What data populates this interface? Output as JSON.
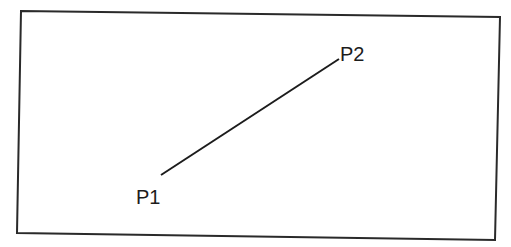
{
  "diagram": {
    "frame": {
      "points": [
        [
          21,
          11
        ],
        [
          500,
          17
        ],
        [
          495,
          240
        ],
        [
          17,
          233
        ]
      ],
      "stroke": "#2a2a2a",
      "stroke_width": 2
    },
    "segment": {
      "from": "P1",
      "to": "P2",
      "x1": 161,
      "y1": 175,
      "x2": 339,
      "y2": 59,
      "stroke": "#1c1c1c",
      "stroke_width": 2
    },
    "points": [
      {
        "id": "P1",
        "label": "P1",
        "label_x": 136,
        "label_y": 204
      },
      {
        "id": "P2",
        "label": "P2",
        "label_x": 340,
        "label_y": 61
      }
    ]
  }
}
